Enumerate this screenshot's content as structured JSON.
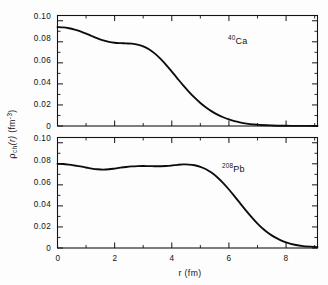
{
  "figure": {
    "background_color": "#fdfdfd",
    "curve_color": "#0c0c0c",
    "axis_color": "#141414"
  },
  "axis_titles": {
    "x": "r (fm)",
    "y_main": "ρ",
    "y_sub": "ch",
    "y_arg": "(r)",
    "y_unit_open": "(fm",
    "y_unit_exp": "-3",
    "y_unit_close": ")"
  },
  "panels": [
    {
      "id": "ca40",
      "annotation_sup": "40",
      "annotation_base": "Ca",
      "y_tick_labels": [
        "0.10",
        "0.08",
        "0.06",
        "0.04",
        "0.02",
        "0"
      ]
    },
    {
      "id": "pb208",
      "annotation_sup": "208",
      "annotation_base": "Pb",
      "y_tick_labels": [
        "0.10",
        "0.08",
        "0.06",
        "0.04",
        "0.02",
        "0"
      ]
    }
  ],
  "x_tick_labels": [
    "0",
    "2",
    "4",
    "6",
    "8"
  ],
  "chart_data": {
    "type": "line",
    "title": "",
    "xlabel": "r (fm)",
    "ylabel": "ρ_ch(r) (fm^-3)",
    "xlim": [
      0,
      9.1
    ],
    "ylim": [
      0,
      0.105
    ],
    "x_ticks": [
      0,
      2,
      4,
      6,
      8
    ],
    "y_ticks": [
      0,
      0.02,
      0.04,
      0.06,
      0.08,
      0.1
    ],
    "x_minor_interval": 1,
    "y_minor_interval": 0.01,
    "grid": false,
    "legend": "none",
    "panel_layout": "stacked-2-shared-x",
    "series": [
      {
        "name": "40Ca",
        "panel": "ca40",
        "annotation": "40Ca",
        "x": [
          0.0,
          0.2,
          0.4,
          0.6,
          0.8,
          1.0,
          1.2,
          1.4,
          1.6,
          1.8,
          2.0,
          2.2,
          2.4,
          2.6,
          2.8,
          3.0,
          3.2,
          3.4,
          3.6,
          3.8,
          4.0,
          4.2,
          4.4,
          4.6,
          4.8,
          5.0,
          5.2,
          5.4,
          5.6,
          5.8,
          6.0,
          6.2,
          6.5,
          7.0,
          7.5,
          8.0,
          8.5,
          9.1
        ],
        "y": [
          0.094,
          0.0937,
          0.0929,
          0.0916,
          0.0899,
          0.0878,
          0.0855,
          0.0833,
          0.0814,
          0.08,
          0.0791,
          0.0787,
          0.0785,
          0.0782,
          0.0774,
          0.0757,
          0.0729,
          0.069,
          0.064,
          0.0581,
          0.0517,
          0.0451,
          0.0386,
          0.0325,
          0.0269,
          0.0219,
          0.0176,
          0.0139,
          0.0108,
          0.0083,
          0.0062,
          0.0046,
          0.0028,
          0.0012,
          0.0005,
          0.0002,
          0.0001,
          0.0
        ]
      },
      {
        "name": "208Pb",
        "panel": "pb208",
        "annotation": "208Pb",
        "x": [
          0.0,
          0.2,
          0.4,
          0.6,
          0.8,
          1.0,
          1.2,
          1.4,
          1.6,
          1.8,
          2.0,
          2.2,
          2.4,
          2.6,
          2.8,
          3.0,
          3.2,
          3.4,
          3.6,
          3.8,
          4.0,
          4.2,
          4.4,
          4.6,
          4.8,
          5.0,
          5.2,
          5.4,
          5.6,
          5.8,
          6.0,
          6.2,
          6.4,
          6.6,
          6.8,
          7.0,
          7.2,
          7.4,
          7.6,
          7.8,
          8.0,
          8.3,
          8.6,
          9.1
        ],
        "y": [
          0.08,
          0.0798,
          0.0792,
          0.0784,
          0.0775,
          0.0765,
          0.0755,
          0.0748,
          0.0745,
          0.0748,
          0.0755,
          0.0763,
          0.077,
          0.0775,
          0.0778,
          0.0779,
          0.0778,
          0.0777,
          0.0777,
          0.0779,
          0.0784,
          0.079,
          0.0794,
          0.0793,
          0.0786,
          0.0772,
          0.0748,
          0.0714,
          0.067,
          0.0617,
          0.0556,
          0.049,
          0.0422,
          0.0355,
          0.0291,
          0.0232,
          0.0181,
          0.0138,
          0.0103,
          0.0075,
          0.0054,
          0.0031,
          0.0018,
          0.0009
        ]
      }
    ]
  }
}
